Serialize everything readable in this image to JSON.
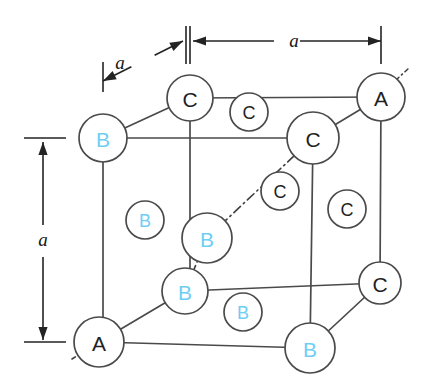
{
  "figure": {
    "background_color": "#ffffff",
    "edge_color": "#4a4a4a",
    "label_colors": {
      "dark": "#1f1f1f",
      "blue": "#6ecef5"
    }
  },
  "dimensions": [
    {
      "name": "top-left-oblique",
      "label": "a",
      "label_x": 120,
      "label_y": 62,
      "orientation": "oblique",
      "x1": 103,
      "y1": 81,
      "x2": 183,
      "y2": 41,
      "tick1": {
        "x": 103,
        "y": 62,
        "len": 30,
        "vertical": true
      },
      "tick2": {
        "x": 186,
        "y": 26,
        "len": 38,
        "vertical": true
      }
    },
    {
      "name": "top-right-horizontal",
      "label": "a",
      "label_x": 294,
      "label_y": 40,
      "orientation": "horizontal",
      "x1": 193,
      "y1": 41,
      "x2": 381,
      "y2": 41,
      "tick1": {
        "x": 190,
        "y": 26,
        "len": 38,
        "vertical": true
      },
      "tick2": {
        "x": 381,
        "y": 26,
        "len": 38,
        "vertical": true
      }
    },
    {
      "name": "left-vertical",
      "label": "a",
      "label_x": 43,
      "label_y": 239,
      "orientation": "vertical",
      "x1": 43,
      "y1": 142,
      "x2": 43,
      "y2": 340,
      "tick1": {
        "x": 24,
        "y": 138,
        "len": 42,
        "vertical": false
      },
      "tick2": {
        "x": 24,
        "y": 342,
        "len": 42,
        "vertical": false
      }
    }
  ],
  "atoms": [
    {
      "name": "back-top-left",
      "label": "B",
      "color": "blue",
      "x": 103,
      "y": 138,
      "r": 24,
      "size": "large",
      "bonded": true
    },
    {
      "name": "back-top-right",
      "label": "C",
      "color": "dark",
      "x": 190,
      "y": 98,
      "r": 23,
      "size": "large",
      "bonded": true
    },
    {
      "name": "top-right-rear",
      "label": "A",
      "color": "dark",
      "x": 381,
      "y": 97,
      "r": 24,
      "size": "large",
      "bonded": true
    },
    {
      "name": "top-right-front",
      "label": "C",
      "color": "dark",
      "x": 313,
      "y": 138,
      "r": 26,
      "size": "large",
      "bonded": true
    },
    {
      "name": "face-top",
      "label": "C",
      "color": "dark",
      "x": 249,
      "y": 112,
      "r": 19,
      "size": "small",
      "bonded": false
    },
    {
      "name": "face-left",
      "label": "B",
      "color": "blue",
      "x": 145,
      "y": 220,
      "r": 19,
      "size": "small",
      "bonded": false
    },
    {
      "name": "face-diagonal",
      "label": "C",
      "color": "dark",
      "x": 280,
      "y": 191,
      "r": 19,
      "size": "small",
      "bonded": false
    },
    {
      "name": "face-right",
      "label": "C",
      "color": "dark",
      "x": 347,
      "y": 209,
      "r": 19,
      "size": "small",
      "bonded": false
    },
    {
      "name": "body-center",
      "label": "B",
      "color": "blue",
      "x": 207,
      "y": 238,
      "r": 25,
      "size": "large",
      "bonded": true
    },
    {
      "name": "front-top-left",
      "label": "B",
      "color": "blue",
      "x": 185,
      "y": 291,
      "r": 23,
      "size": "large",
      "bonded": true
    },
    {
      "name": "face-bottom",
      "label": "B",
      "color": "blue",
      "x": 243,
      "y": 312,
      "r": 19,
      "size": "small",
      "bonded": false
    },
    {
      "name": "front-bottom-left",
      "label": "A",
      "color": "dark",
      "x": 99,
      "y": 342,
      "r": 25,
      "size": "large",
      "bonded": true
    },
    {
      "name": "front-bottom-right",
      "label": "B",
      "color": "blue",
      "x": 310,
      "y": 348,
      "r": 25,
      "size": "large",
      "bonded": true
    },
    {
      "name": "right-bottom-rear",
      "label": "C",
      "color": "dark",
      "x": 380,
      "y": 283,
      "r": 21,
      "size": "large",
      "bonded": true
    }
  ],
  "edges": [
    {
      "name": "edge-back-top",
      "x1": 103,
      "y1": 138,
      "x2": 190,
      "y2": 98
    },
    {
      "name": "edge-top-rear",
      "x1": 190,
      "y1": 98,
      "x2": 381,
      "y2": 97
    },
    {
      "name": "edge-back-left-vertical",
      "x1": 103,
      "y1": 138,
      "x2": 103,
      "y2": 342
    },
    {
      "name": "edge-top-front",
      "x1": 103,
      "y1": 138,
      "x2": 313,
      "y2": 138
    },
    {
      "name": "edge-top-middle-vertical",
      "x1": 190,
      "y1": 98,
      "x2": 190,
      "y2": 291
    },
    {
      "name": "edge-right-rear-vertical",
      "x1": 381,
      "y1": 97,
      "x2": 380,
      "y2": 283
    },
    {
      "name": "edge-top-right-diagonal",
      "x1": 313,
      "y1": 138,
      "x2": 381,
      "y2": 97
    },
    {
      "name": "edge-right-front-vertical",
      "x1": 313,
      "y1": 138,
      "x2": 310,
      "y2": 348
    },
    {
      "name": "edge-bottom-front",
      "x1": 99,
      "y1": 342,
      "x2": 310,
      "y2": 348
    },
    {
      "name": "edge-bottom-middle",
      "x1": 185,
      "y1": 291,
      "x2": 380,
      "y2": 283
    },
    {
      "name": "edge-bottom-left-diagonal",
      "x1": 99,
      "y1": 342,
      "x2": 185,
      "y2": 291
    },
    {
      "name": "edge-bottom-right-diagonal",
      "x1": 310,
      "y1": 348,
      "x2": 380,
      "y2": 283
    }
  ],
  "axis_lines": [
    {
      "name": "body-diagonal-lower",
      "x1": 185,
      "y1": 291,
      "x2": 207,
      "y2": 238
    },
    {
      "name": "body-diagonal-upper",
      "x1": 207,
      "y1": 238,
      "x2": 313,
      "y2": 138
    }
  ],
  "axis_stubs": [
    {
      "name": "stub-upper-right",
      "x1": 396,
      "y1": 80,
      "x2": 409,
      "y2": 68
    },
    {
      "name": "stub-lower-left",
      "x1": 72,
      "y1": 359,
      "x2": 83,
      "y2": 352
    }
  ]
}
